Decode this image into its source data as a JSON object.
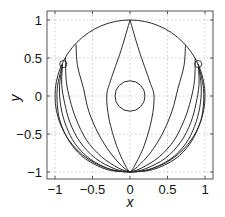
{
  "chart_data": {
    "type": "line",
    "title": "",
    "xlabel": "x",
    "ylabel": "y",
    "xlim": [
      -1.1,
      1.1
    ],
    "ylim": [
      -1.1,
      1.1
    ],
    "grid": true,
    "xticks": [
      -1,
      -0.5,
      0,
      0.5,
      1
    ],
    "xtick_labels": [
      "−1",
      "−0.5",
      "0",
      "0.5",
      "1"
    ],
    "yticks": [
      -1,
      -0.5,
      0,
      0.5,
      1
    ],
    "ytick_labels": [
      "−1",
      "−0.5",
      "0",
      "0.5",
      "1"
    ],
    "outer_circle": {
      "cx": 0,
      "cy": 0,
      "r": 1
    },
    "inner_circle": {
      "cx": 0,
      "cy": 0,
      "r": 0.2
    },
    "markers": [
      {
        "x": -0.89,
        "y": 0.42,
        "shape": "circle"
      },
      {
        "x": 0.91,
        "y": 0.42,
        "shape": "circle"
      }
    ],
    "series": [
      {
        "name": "curve-1",
        "points": [
          [
            0,
            1
          ],
          [
            -0.12,
            0.6
          ],
          [
            -0.26,
            0.2
          ],
          [
            -0.31,
            0
          ],
          [
            -0.28,
            -0.3
          ],
          [
            -0.18,
            -0.65
          ],
          [
            -0.06,
            -0.92
          ],
          [
            0,
            -1
          ]
        ]
      },
      {
        "name": "curve-2",
        "points": [
          [
            0,
            1
          ],
          [
            0.12,
            0.6
          ],
          [
            0.26,
            0.2
          ],
          [
            0.32,
            0
          ],
          [
            0.29,
            -0.3
          ],
          [
            0.19,
            -0.65
          ],
          [
            0.06,
            -0.92
          ],
          [
            0,
            -1
          ]
        ]
      },
      {
        "name": "curve-3",
        "points": [
          [
            -0.72,
            0.68
          ],
          [
            -0.7,
            0.4
          ],
          [
            -0.62,
            0.1
          ],
          [
            -0.55,
            -0.2
          ],
          [
            -0.42,
            -0.5
          ],
          [
            -0.26,
            -0.75
          ],
          [
            -0.1,
            -0.93
          ],
          [
            0,
            -1
          ]
        ]
      },
      {
        "name": "curve-4",
        "points": [
          [
            0.74,
            0.67
          ],
          [
            0.72,
            0.4
          ],
          [
            0.64,
            0.1
          ],
          [
            0.56,
            -0.2
          ],
          [
            0.43,
            -0.5
          ],
          [
            0.27,
            -0.75
          ],
          [
            0.1,
            -0.93
          ],
          [
            0,
            -1
          ]
        ]
      },
      {
        "name": "curve-5",
        "points": [
          [
            -0.86,
            0.5
          ],
          [
            -0.85,
            0.2
          ],
          [
            -0.8,
            -0.05
          ],
          [
            -0.72,
            -0.3
          ],
          [
            -0.58,
            -0.58
          ],
          [
            -0.38,
            -0.8
          ],
          [
            -0.15,
            -0.95
          ],
          [
            0,
            -1
          ]
        ]
      },
      {
        "name": "curve-6",
        "points": [
          [
            0.87,
            0.49
          ],
          [
            0.86,
            0.2
          ],
          [
            0.81,
            -0.05
          ],
          [
            0.73,
            -0.3
          ],
          [
            0.59,
            -0.58
          ],
          [
            0.39,
            -0.8
          ],
          [
            0.15,
            -0.95
          ],
          [
            0,
            -1
          ]
        ]
      },
      {
        "name": "curve-7",
        "points": [
          [
            -0.9,
            0.42
          ],
          [
            -0.91,
            0.15
          ],
          [
            -0.87,
            -0.1
          ],
          [
            -0.8,
            -0.35
          ],
          [
            -0.67,
            -0.6
          ],
          [
            -0.46,
            -0.82
          ],
          [
            -0.2,
            -0.96
          ],
          [
            0,
            -1
          ]
        ]
      },
      {
        "name": "curve-8",
        "points": [
          [
            0.91,
            0.42
          ],
          [
            0.92,
            0.15
          ],
          [
            0.88,
            -0.1
          ],
          [
            0.81,
            -0.35
          ],
          [
            0.68,
            -0.6
          ],
          [
            0.47,
            -0.82
          ],
          [
            0.2,
            -0.96
          ],
          [
            0,
            -1
          ]
        ]
      },
      {
        "name": "curve-9",
        "points": [
          [
            -0.9,
            0.42
          ],
          [
            -0.94,
            0.12
          ],
          [
            -0.92,
            -0.15
          ],
          [
            -0.85,
            -0.4
          ],
          [
            -0.73,
            -0.63
          ],
          [
            -0.53,
            -0.83
          ],
          [
            -0.25,
            -0.97
          ],
          [
            0,
            -1
          ]
        ]
      },
      {
        "name": "curve-10",
        "points": [
          [
            0.91,
            0.42
          ],
          [
            0.95,
            0.12
          ],
          [
            0.93,
            -0.15
          ],
          [
            0.86,
            -0.4
          ],
          [
            0.74,
            -0.63
          ],
          [
            0.54,
            -0.83
          ],
          [
            0.25,
            -0.97
          ],
          [
            0,
            -1
          ]
        ]
      },
      {
        "name": "curve-11",
        "points": [
          [
            -0.9,
            0.42
          ],
          [
            -0.97,
            0.1
          ],
          [
            -0.96,
            -0.2
          ],
          [
            -0.9,
            -0.42
          ],
          [
            -0.78,
            -0.64
          ],
          [
            -0.59,
            -0.83
          ],
          [
            -0.3,
            -0.97
          ],
          [
            0,
            -1
          ]
        ]
      },
      {
        "name": "curve-12",
        "points": [
          [
            0.91,
            0.42
          ],
          [
            0.98,
            0.1
          ],
          [
            0.97,
            -0.2
          ],
          [
            0.91,
            -0.42
          ],
          [
            0.79,
            -0.64
          ],
          [
            0.6,
            -0.83
          ],
          [
            0.3,
            -0.97
          ],
          [
            0,
            -1
          ]
        ]
      }
    ]
  }
}
